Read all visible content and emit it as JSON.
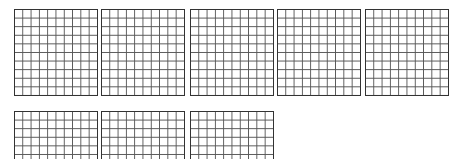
{
  "figure": {
    "grid_count": 8,
    "rows": [
      5,
      3
    ],
    "cells_per_grid": 100,
    "grid_dims": [
      10,
      10
    ],
    "line_color": "#555555",
    "border_color": "#333333"
  }
}
